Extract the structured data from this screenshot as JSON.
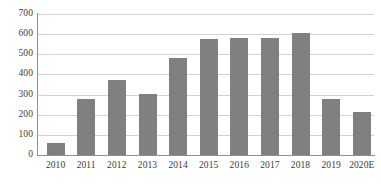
{
  "chart_data": {
    "type": "bar",
    "title": "",
    "subtitle": "",
    "xlabel": "",
    "ylabel": "",
    "categories": [
      "2010",
      "2011",
      "2012",
      "2013",
      "2014",
      "2015",
      "2016",
      "2017",
      "2018",
      "2019",
      "2020E"
    ],
    "values": [
      60,
      280,
      370,
      305,
      480,
      575,
      580,
      580,
      605,
      280,
      215
    ],
    "series": [
      {
        "name": "",
        "values": [
          60,
          280,
          370,
          305,
          480,
          575,
          580,
          580,
          605,
          280,
          215
        ]
      }
    ],
    "ylim": [
      0,
      700
    ],
    "ytick_labels": [
      "0",
      "100",
      "200",
      "300",
      "400",
      "500",
      "600",
      "700"
    ],
    "ytick_values": [
      0,
      100,
      200,
      300,
      400,
      500,
      600,
      700
    ],
    "grid": true,
    "grid_axis": "y",
    "legend": false,
    "legend_position": "none",
    "bar_color": "#808080",
    "gridline_color": "#d2d2d2",
    "axis_color": "#8f8f8f",
    "background_color": "#ffffff",
    "text_color": "#3a3a3a",
    "annotations": []
  }
}
